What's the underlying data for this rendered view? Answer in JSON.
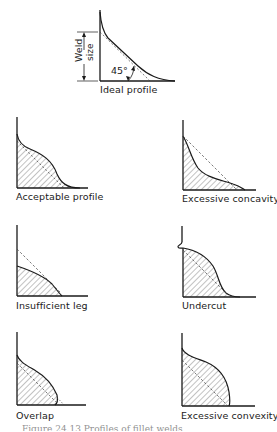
{
  "figure": {
    "caption": "Figure 24.13   Profiles of fillet welds",
    "ideal": {
      "label": "Ideal profile",
      "dimension_label_1": "Weld",
      "dimension_label_2": "size",
      "angle_label": "45°"
    },
    "profiles": [
      {
        "id": "acceptable",
        "label": "Acceptable profile"
      },
      {
        "id": "excessive-concavity",
        "label": "Excessive concavity"
      },
      {
        "id": "insufficient-leg",
        "label": "Insufficient leg"
      },
      {
        "id": "undercut",
        "label": "Undercut"
      },
      {
        "id": "overlap",
        "label": "Overlap"
      },
      {
        "id": "excessive-convexity",
        "label": "Excessive convexity"
      }
    ],
    "colors": {
      "ink": "#1a1a1a",
      "hatch": "#555555",
      "background": "#ffffff"
    }
  }
}
